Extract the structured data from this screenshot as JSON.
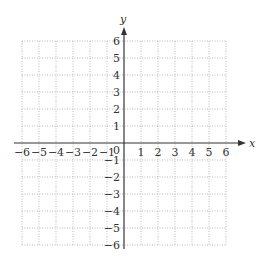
{
  "chart_data": {
    "type": "scatter",
    "title": "",
    "xlabel": "x",
    "ylabel": "y",
    "xlim": [
      -6,
      6
    ],
    "ylim": [
      -6,
      6
    ],
    "grid": true,
    "grid_style": "dotted",
    "x_ticks": [
      -6,
      -5,
      -4,
      -3,
      -2,
      -1,
      1,
      2,
      3,
      4,
      5,
      6
    ],
    "y_ticks": [
      -6,
      -5,
      -4,
      -3,
      -2,
      -1,
      1,
      2,
      3,
      4,
      5,
      6
    ],
    "x_tick_labels": [
      "−6",
      "−5",
      "−4",
      "−3",
      "−2",
      "−1",
      "1",
      "2",
      "3",
      "4",
      "5",
      "6"
    ],
    "y_tick_labels": [
      "−6",
      "−5",
      "−4",
      "−3",
      "−2",
      "−1",
      "1",
      "2",
      "3",
      "4",
      "5",
      "6"
    ],
    "origin_label": "0",
    "series": [],
    "legend": null
  },
  "colors": {
    "axis": "#333333",
    "grid": "#aaaaaa",
    "text": "#333333"
  }
}
